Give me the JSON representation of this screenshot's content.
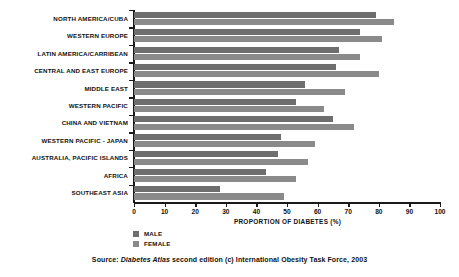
{
  "chart_data": {
    "type": "bar",
    "orientation": "horizontal",
    "title": "",
    "xlabel": "PROPORTION OF DIABETES (%)",
    "ylabel": "",
    "xlim": [
      0,
      100
    ],
    "xticks": [
      0,
      10,
      20,
      30,
      40,
      50,
      60,
      70,
      80,
      90,
      100
    ],
    "grid": false,
    "legend_position": "below-left",
    "categories": [
      "NORTH AMERICA/CUBA",
      "WESTERN EUROPE",
      "LATIN AMERICA/CARRIBEAN",
      "CENTRAL AND EAST EUROPE",
      "MIDDLE EAST",
      "WESTERN PACIFIC",
      "CHINA AND VIETNAM",
      "WESTERN PACIFIC - JAPAN",
      "AUSTRALIA, PACIFIC ISLANDS",
      "AFRICA",
      "SOUTHEAST ASIA"
    ],
    "series": [
      {
        "name": "MALE",
        "color": "#6e6e6e",
        "values": [
          79,
          74,
          67,
          66,
          56,
          53,
          65,
          48,
          47,
          43,
          28
        ]
      },
      {
        "name": "FEMALE",
        "color": "#8a8a8a",
        "values": [
          85,
          81,
          74,
          80,
          69,
          62,
          72,
          59,
          57,
          53,
          49
        ]
      }
    ]
  },
  "source": {
    "prefix": "Source:",
    "italic": "Diabetes Atlas",
    "suffix": "second edition (c) International Obesity Task Force, 2003"
  }
}
